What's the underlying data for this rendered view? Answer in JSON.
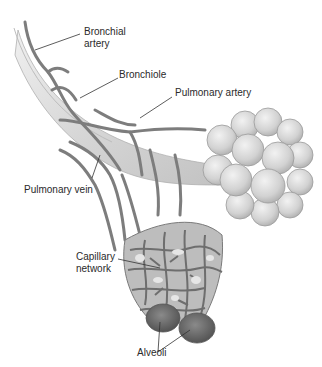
{
  "diagram": {
    "title": "",
    "labels": {
      "bronchial_artery": [
        "Bronchial",
        "artery"
      ],
      "bronchiole": "Bronchiole",
      "pulmonary_artery": "Pulmonary artery",
      "pulmonary_vein": "Pulmonary vein",
      "capillary_network": [
        "Capillary",
        "network"
      ],
      "alveoli": "Alveoli"
    },
    "colors": {
      "background": "#ffffff",
      "bronchiole_fill": "#d9d9d9",
      "vessel": "#7d7d7d",
      "alveolar_sac": "#cfcfcf",
      "capillary": "#6e6e6e",
      "alveoli_dark": "#6a6a6a",
      "leader_line": "#333333",
      "text": "#2a2a2a"
    }
  }
}
